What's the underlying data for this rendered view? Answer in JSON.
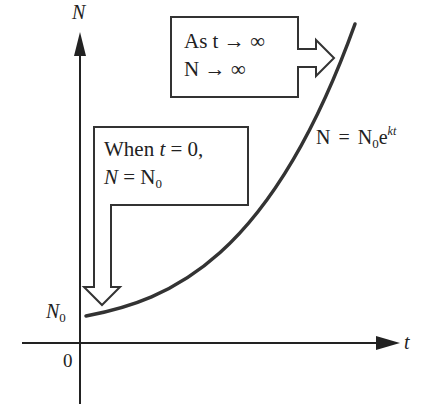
{
  "diagram": {
    "axes": {
      "y_label": "N",
      "x_label": "t",
      "origin_label": "0",
      "y_intercept_label": "N",
      "y_intercept_sub": "0"
    },
    "curve_label": {
      "lhs": "N",
      "eq": "=",
      "base": "N",
      "base_sub": "0",
      "e": "e",
      "exp": "kt"
    },
    "callout_infinity": {
      "line1": "As t → ∞",
      "line2": "N → ∞"
    },
    "callout_initial": {
      "line1_a": "When ",
      "line1_t": "t",
      "line1_b": " = 0,",
      "line2_a": "N",
      "line2_b": " = N",
      "line2_sub": "0"
    },
    "colors": {
      "ink": "#222222",
      "background": "#ffffff"
    }
  }
}
